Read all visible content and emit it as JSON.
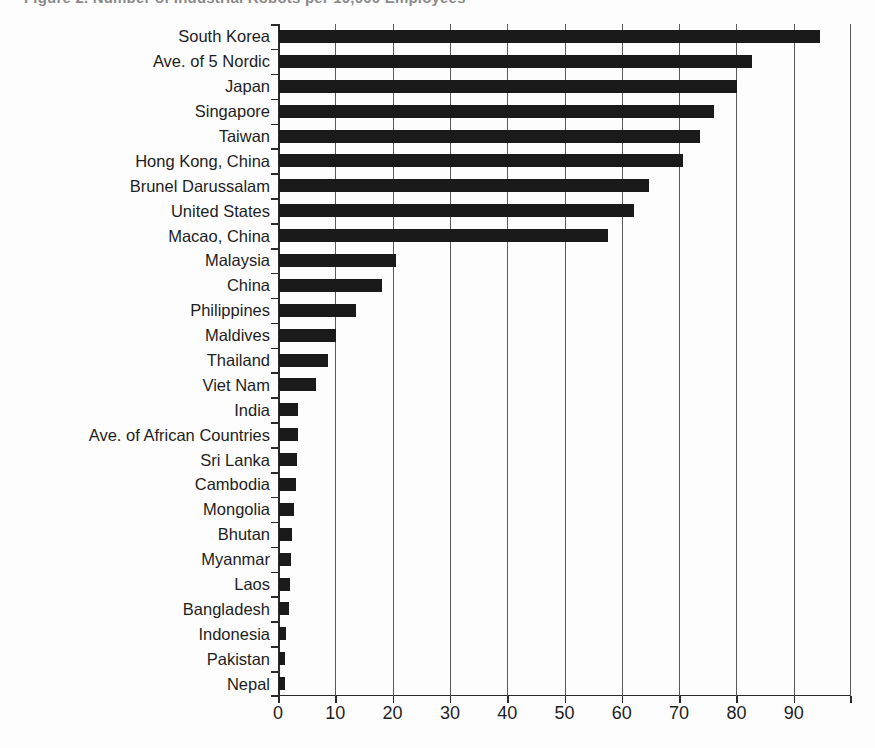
{
  "title": "Figure 2. Number of Industrial Robots per 10,000 Employees",
  "chart_data": {
    "type": "bar",
    "orientation": "horizontal",
    "title": "",
    "xlabel": "",
    "ylabel": "",
    "xlim": [
      0,
      100
    ],
    "grid": true,
    "legend": "none",
    "xticks": [
      "0",
      "10",
      "20",
      "30",
      "40",
      "50",
      "60",
      "70",
      "80",
      "90"
    ],
    "xtick_values": [
      0,
      10,
      20,
      30,
      40,
      50,
      60,
      70,
      80,
      90
    ],
    "categories": [
      "South Korea",
      "Ave. of 5 Nordic",
      "Japan",
      "Singapore",
      "Taiwan",
      "Hong Kong, China",
      "Brunel Darussalam",
      "United States",
      "Macao, China",
      "Malaysia",
      "China",
      "Philippines",
      "Maldives",
      "Thailand",
      "Viet Nam",
      "India",
      "Ave. of African Countries",
      "Sri Lanka",
      "Cambodia",
      "Mongolia",
      "Bhutan",
      "Myanmar",
      "Laos",
      "Bangladesh",
      "Indonesia",
      "Pakistan",
      "Nepal"
    ],
    "values": [
      94.5,
      82.5,
      80,
      76,
      73.5,
      70.5,
      64.5,
      62,
      57.5,
      20.5,
      18,
      13.5,
      10,
      8.5,
      6.5,
      3.3,
      3.3,
      3.1,
      3,
      2.7,
      2.3,
      2.1,
      2,
      1.8,
      1.3,
      1,
      1
    ]
  },
  "colors": {
    "bar": "#1a1a1a",
    "grid": "#5a5a5a",
    "axis": "#2a2a2a",
    "text": "#1d1d1d",
    "background": "#fdfdfd"
  }
}
